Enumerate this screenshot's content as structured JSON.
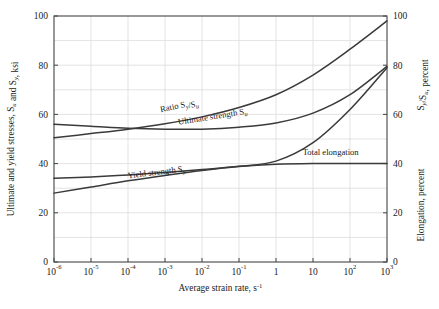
{
  "chart_data": {
    "type": "line",
    "title": "",
    "xlabel": "Average strain rate, s",
    "xlabel_exponent": "-1",
    "ylabel_left": "Ultimate and yield stresses, S",
    "ylabel_left_sub1": "u",
    "ylabel_left_mid": " and S",
    "ylabel_left_sub2": "y",
    "ylabel_left_end": ", ksi",
    "ylabel_right_upper": "S",
    "ylabel_right_upper_sub1": "y",
    "ylabel_right_upper_mid": "/S",
    "ylabel_right_upper_sub2": "u",
    "ylabel_right_upper_end": ", percent",
    "ylabel_right_lower": "Elongation, percent",
    "xscale": "log",
    "xlim": [
      1e-06,
      1000
    ],
    "ylim": [
      0,
      100
    ],
    "yticks": [
      0,
      20,
      40,
      60,
      80,
      100
    ],
    "yticks_right": [
      0,
      20,
      40,
      60,
      80,
      100
    ],
    "ygrid_minor": [
      10,
      30,
      50,
      70,
      90
    ],
    "xticks": [
      "10",
      "10",
      "10",
      "10",
      "10",
      "10",
      "1",
      "10",
      "10",
      "10"
    ],
    "xtick_exponents": [
      "-6",
      "-5",
      "-4",
      "-3",
      "-2",
      "-1",
      "",
      "",
      "2",
      "3"
    ],
    "xtick_values": [
      1e-06,
      1e-05,
      0.0001,
      0.001,
      0.01,
      0.1,
      1,
      10,
      100,
      1000
    ],
    "grid": true,
    "legend_position": "inline-labels",
    "series": [
      {
        "name": "Ratio Sy/Su",
        "label": "Ratio S",
        "label_sub1": "y",
        "label_mid": "/S",
        "label_sub2": "u",
        "x": [
          1e-06,
          1e-05,
          0.0001,
          0.001,
          0.01,
          0.1,
          1,
          10,
          100,
          1000
        ],
        "y": [
          50.5,
          52.2,
          54.0,
          56.2,
          59.0,
          62.8,
          68.0,
          76.0,
          86.5,
          98.0
        ],
        "label_x": 0.0025,
        "label_y": 62.5,
        "label_rotation": -12
      },
      {
        "name": "Ultimate strength Su",
        "label": "Ultimate strength S",
        "label_sub1": "u",
        "x": [
          1e-06,
          1e-05,
          0.0001,
          0.001,
          0.01,
          0.1,
          1,
          10,
          100,
          1000
        ],
        "y": [
          56.0,
          55.2,
          54.4,
          54.0,
          54.0,
          54.8,
          56.5,
          60.5,
          68.0,
          79.5
        ],
        "label_x": 0.02,
        "label_y": 58.0,
        "label_rotation": -9
      },
      {
        "name": "Total elongation",
        "label": "Total elongation",
        "x": [
          1e-06,
          1e-05,
          0.0001,
          0.001,
          0.01,
          0.1,
          1,
          10,
          100,
          1000
        ],
        "y": [
          34.0,
          34.6,
          35.4,
          36.4,
          37.6,
          38.9,
          41.0,
          48.5,
          62.0,
          79.0
        ],
        "label_x": 30,
        "label_y": 43.5,
        "label_rotation": 0
      },
      {
        "name": "Yield strength Sy",
        "label": "Yield strength S",
        "label_sub1": "y",
        "x": [
          1e-06,
          1e-05,
          0.0001,
          0.001,
          0.01,
          0.1,
          1,
          10,
          100,
          1000
        ],
        "y": [
          28.0,
          30.5,
          33.0,
          35.2,
          37.2,
          38.8,
          39.7,
          40.0,
          40.0,
          40.0
        ],
        "label_x": 0.0006,
        "label_y": 35.4,
        "label_rotation": -7
      }
    ],
    "colors": {
      "curve": "#3a3a3a",
      "grid": "#dcdcdc",
      "axis": "#444444",
      "background": "#ffffff",
      "text": "#1a1a1a"
    }
  }
}
